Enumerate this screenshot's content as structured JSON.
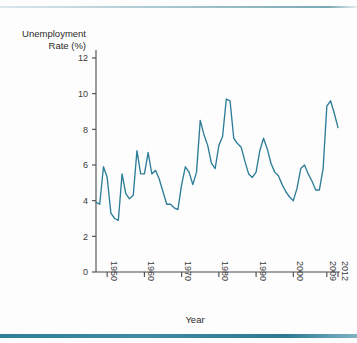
{
  "figure": {
    "background_color": "#fdfdfd",
    "rule_color": "#2f7f97"
  },
  "axis_titles": {
    "x": "Year",
    "y_line1": "Unemployment",
    "y_line2": "Rate (%)"
  },
  "chart_data": {
    "type": "line",
    "title": "",
    "subtitle": "",
    "xlabel": "Year",
    "ylabel": "Unemployment Rate (%)",
    "grid": false,
    "legend": false,
    "legend_position": "none",
    "line_color": "#2e7d98",
    "xlim": [
      1947,
      2012
    ],
    "ylim": [
      0,
      13
    ],
    "ytick_values": [
      0,
      2,
      4,
      6,
      8,
      10,
      12
    ],
    "ytick_labels": [
      "0",
      "2",
      "4",
      "6",
      "8",
      "10",
      "12"
    ],
    "xtick_values": [
      1950,
      1960,
      1970,
      1980,
      1990,
      2000,
      2009,
      2012
    ],
    "xtick_labels": [
      "1950",
      "1960",
      "1970",
      "1980",
      "1990",
      "2000",
      "2009",
      "2012"
    ],
    "xtick_rotation": 90,
    "series": [
      {
        "name": "Unemployment Rate",
        "x": [
          1947,
          1948,
          1949,
          1950,
          1951,
          1952,
          1953,
          1954,
          1955,
          1956,
          1957,
          1958,
          1959,
          1960,
          1961,
          1962,
          1963,
          1964,
          1965,
          1966,
          1967,
          1968,
          1969,
          1970,
          1971,
          1972,
          1973,
          1974,
          1975,
          1976,
          1977,
          1978,
          1979,
          1980,
          1981,
          1982,
          1983,
          1984,
          1985,
          1986,
          1987,
          1988,
          1989,
          1990,
          1991,
          1992,
          1993,
          1994,
          1995,
          1996,
          1997,
          1998,
          1999,
          2000,
          2001,
          2002,
          2003,
          2004,
          2005,
          2006,
          2007,
          2008,
          2009,
          2010,
          2011,
          2012
        ],
        "values": [
          3.9,
          3.8,
          5.9,
          5.3,
          3.3,
          3.0,
          2.9,
          5.5,
          4.4,
          4.1,
          4.3,
          6.8,
          5.5,
          5.5,
          6.7,
          5.5,
          5.7,
          5.2,
          4.5,
          3.8,
          3.8,
          3.6,
          3.5,
          4.9,
          5.9,
          5.6,
          4.9,
          5.6,
          8.5,
          7.7,
          7.1,
          6.1,
          5.8,
          7.1,
          7.6,
          9.7,
          9.6,
          7.5,
          7.2,
          7.0,
          6.2,
          5.5,
          5.3,
          5.6,
          6.8,
          7.5,
          6.9,
          6.1,
          5.6,
          5.4,
          4.9,
          4.5,
          4.2,
          4.0,
          4.7,
          5.8,
          6.0,
          5.5,
          5.1,
          4.6,
          4.6,
          5.8,
          9.3,
          9.6,
          8.9,
          8.1
        ]
      }
    ]
  }
}
